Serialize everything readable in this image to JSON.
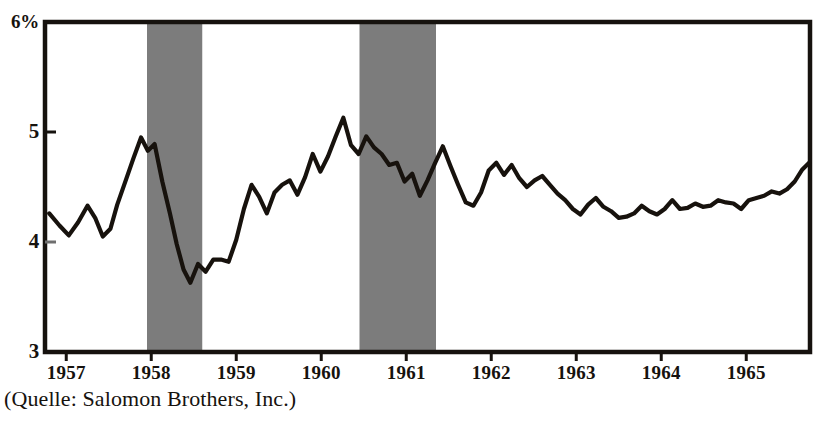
{
  "chart_data": {
    "type": "line",
    "title": "",
    "subtitle": "",
    "xlabel": "",
    "ylabel": "",
    "ylim": [
      3,
      6
    ],
    "xlim": [
      1956.75,
      1965.75
    ],
    "grid": false,
    "legend": null,
    "y_axis_unit": "%",
    "y_ticks": [
      "6%",
      "5",
      "4",
      "3"
    ],
    "y_tick_values": [
      6,
      5,
      4,
      3
    ],
    "x_ticks": [
      "1957",
      "1958",
      "1959",
      "1960",
      "1961",
      "1962",
      "1963",
      "1964",
      "1965"
    ],
    "x_tick_values": [
      1957,
      1958,
      1959,
      1960,
      1961,
      1962,
      1963,
      1964,
      1965
    ],
    "line_color": "#17120d",
    "shade_color": "#7c7c7c",
    "frame_color": "#16120e",
    "background": "#ffffff",
    "annotations": [
      {
        "label": "recession band 1",
        "x_start": 1957.95,
        "x_end": 1958.6
      },
      {
        "label": "recession band 2",
        "x_start": 1960.45,
        "x_end": 1961.35
      }
    ],
    "series": [
      {
        "name": "Yield",
        "x": [
          1956.8,
          1956.92,
          1957.03,
          1957.14,
          1957.25,
          1957.34,
          1957.43,
          1957.52,
          1957.6,
          1957.7,
          1957.79,
          1957.88,
          1957.96,
          1958.04,
          1958.13,
          1958.22,
          1958.3,
          1958.38,
          1958.46,
          1958.55,
          1958.64,
          1958.73,
          1958.82,
          1958.91,
          1959.0,
          1959.09,
          1959.18,
          1959.27,
          1959.36,
          1959.45,
          1959.54,
          1959.63,
          1959.72,
          1959.81,
          1959.9,
          1959.99,
          1960.08,
          1960.17,
          1960.26,
          1960.35,
          1960.44,
          1960.53,
          1960.62,
          1960.71,
          1960.8,
          1960.89,
          1960.98,
          1961.07,
          1961.16,
          1961.25,
          1961.34,
          1961.43,
          1961.52,
          1961.61,
          1961.7,
          1961.79,
          1961.88,
          1961.97,
          1962.06,
          1962.15,
          1962.24,
          1962.33,
          1962.42,
          1962.51,
          1962.6,
          1962.69,
          1962.78,
          1962.87,
          1962.96,
          1963.05,
          1963.14,
          1963.23,
          1963.32,
          1963.41,
          1963.5,
          1963.59,
          1963.68,
          1963.77,
          1963.86,
          1963.95,
          1964.04,
          1964.13,
          1964.22,
          1964.31,
          1964.4,
          1964.49,
          1964.58,
          1964.67,
          1964.76,
          1964.85,
          1964.94,
          1965.03,
          1965.12,
          1965.21,
          1965.3,
          1965.39,
          1965.48,
          1965.57,
          1965.66,
          1965.74
        ],
        "values": [
          4.26,
          4.15,
          4.06,
          4.18,
          4.33,
          4.22,
          4.05,
          4.12,
          4.34,
          4.56,
          4.76,
          4.95,
          4.83,
          4.89,
          4.55,
          4.26,
          3.98,
          3.75,
          3.63,
          3.8,
          3.73,
          3.84,
          3.84,
          3.82,
          4.02,
          4.3,
          4.52,
          4.41,
          4.26,
          4.45,
          4.52,
          4.56,
          4.43,
          4.59,
          4.8,
          4.64,
          4.78,
          4.96,
          5.13,
          4.88,
          4.8,
          4.96,
          4.86,
          4.8,
          4.7,
          4.72,
          4.55,
          4.62,
          4.42,
          4.56,
          4.72,
          4.87,
          4.69,
          4.52,
          4.36,
          4.33,
          4.45,
          4.65,
          4.72,
          4.61,
          4.7,
          4.58,
          4.5,
          4.56,
          4.6,
          4.52,
          4.44,
          4.38,
          4.3,
          4.25,
          4.34,
          4.4,
          4.32,
          4.28,
          4.22,
          4.23,
          4.26,
          4.33,
          4.28,
          4.25,
          4.3,
          4.38,
          4.3,
          4.31,
          4.35,
          4.32,
          4.33,
          4.38,
          4.36,
          4.35,
          4.3,
          4.38,
          4.4,
          4.42,
          4.46,
          4.44,
          4.48,
          4.55,
          4.66,
          4.72
        ]
      }
    ]
  },
  "caption": {
    "source_note": "(Quelle: Salomon Brothers, Inc.)"
  }
}
